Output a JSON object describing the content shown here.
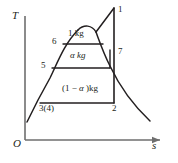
{
  "figure": {
    "axes": {
      "y_label": "T",
      "x_label": "s",
      "origin_label": "O"
    },
    "state_points": [
      {
        "id": "p1",
        "label": "1"
      },
      {
        "id": "p7",
        "label": "7"
      },
      {
        "id": "p2",
        "label": "2"
      },
      {
        "id": "p6",
        "label": "6"
      },
      {
        "id": "p5",
        "label": "5"
      },
      {
        "id": "p34",
        "label": "3(4)"
      }
    ],
    "region_labels": [
      {
        "id": "top",
        "label": "1 kg"
      },
      {
        "id": "middle",
        "label": "α kg"
      },
      {
        "id": "bottom_prefix",
        "label": "(1 − "
      },
      {
        "id": "bottom_alpha",
        "label": "α"
      },
      {
        "id": "bottom_suffix",
        "label": " )kg"
      }
    ],
    "colors": {
      "ink": "#231f20",
      "axis": "#6e6e6e",
      "background": "#ffffff"
    }
  }
}
